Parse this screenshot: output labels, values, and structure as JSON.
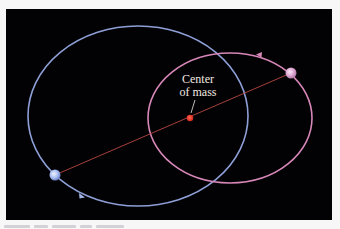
{
  "diagram": {
    "labels": {
      "center_of_mass_line1": "Center",
      "center_of_mass_line2": "of mass"
    },
    "colors": {
      "background": "#020205",
      "page": "#f7f7f7",
      "blue_orbit": "#8e9fd6",
      "pink_orbit": "#d787b8",
      "connecting_line": "#c0514a",
      "center_of_mass": "#e0281f",
      "blue_star": "#b5c7f2",
      "pink_star": "#e5b2dc",
      "label_text": "#f3e9e0"
    },
    "blue_orbit": {
      "cx": 138,
      "cy": 116,
      "rx": 110,
      "ry": 90
    },
    "pink_orbit": {
      "cx": 230,
      "cy": 118,
      "rx": 82,
      "ry": 65
    },
    "center_of_mass": {
      "x": 190,
      "y": 118
    },
    "blue_star": {
      "x": 55,
      "y": 175
    },
    "pink_star": {
      "x": 291,
      "y": 73
    }
  }
}
